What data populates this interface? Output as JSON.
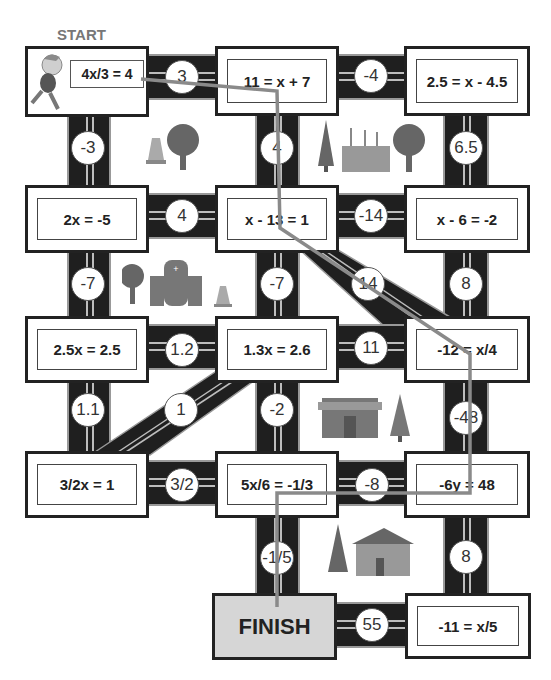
{
  "game": {
    "start_label": "START",
    "finish_label": "FINISH",
    "path_color": "#8a8a8a",
    "equations": [
      {
        "id": "r1c1",
        "text": "4x/3 = 4"
      },
      {
        "id": "r1c2",
        "text": "11 = x + 7"
      },
      {
        "id": "r1c3",
        "text": "2.5 = x - 4.5"
      },
      {
        "id": "r2c1",
        "text": "2x = -5"
      },
      {
        "id": "r2c2",
        "text": "x - 13 = 1"
      },
      {
        "id": "r2c3",
        "text": "x - 6 = -2"
      },
      {
        "id": "r3c1",
        "text": "2.5x = 2.5"
      },
      {
        "id": "r3c2",
        "text": "1.3x = 2.6"
      },
      {
        "id": "r3c3",
        "text": "-12 = x/4"
      },
      {
        "id": "r4c1",
        "text": "3/2x = 1"
      },
      {
        "id": "r4c2",
        "text": "5x/6 = -1/3"
      },
      {
        "id": "r4c3",
        "text": "-6y = 48"
      },
      {
        "id": "r5c3",
        "text": "-11 = x/5"
      }
    ],
    "road_values": {
      "r1_h1": "3",
      "r1_h2": "-4",
      "v1_c1": "-3",
      "v1_c2": "4",
      "v1_c3": "6.5",
      "r2_h1": "4",
      "r2_h2": "-14",
      "v2_c1": "-7",
      "v2_c2": "-7",
      "v2_diag": "14",
      "v2_c3": "8",
      "r3_h1": "1.2",
      "r3_h2": "11",
      "v3_c1": "1.1",
      "v3_diag": "1",
      "v3_c2": "-2",
      "v3_c3": "-48",
      "r4_h1": "3/2",
      "r4_h2": "-8",
      "v4_c2": "-1/5",
      "v4_c3": "8",
      "r5_h1": "55"
    },
    "decorations": [
      "traffic-cone",
      "tree",
      "pine-tree",
      "factory",
      "tree",
      "tree",
      "hospital",
      "traffic-cone",
      "store",
      "pine-tree",
      "pine-tree",
      "house"
    ]
  }
}
